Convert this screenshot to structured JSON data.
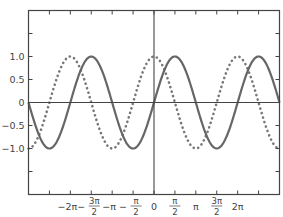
{
  "chart_data": {
    "type": "line",
    "title": "",
    "xlabel": "",
    "ylabel": "",
    "xlim": [
      -9.42478,
      9.42478
    ],
    "ylim": [
      -2.0,
      2.0
    ],
    "grid": false,
    "legend": null,
    "frame": "box with axis lines through origin",
    "series": [
      {
        "name": "sin(x)",
        "style": "solid",
        "color": "#666666",
        "function": "sin"
      },
      {
        "name": "cos(x)",
        "style": "dotted",
        "color": "#777777",
        "function": "cos"
      }
    ],
    "x_ticks": [
      {
        "value": -7.85398,
        "label": ""
      },
      {
        "value": -6.28319,
        "label": "−2π"
      },
      {
        "value": -4.71239,
        "label": "−3π/2",
        "num": "3π",
        "den": "2",
        "neg": true
      },
      {
        "value": -3.14159,
        "label": "−π"
      },
      {
        "value": -1.5708,
        "label": "−π/2",
        "num": "π",
        "den": "2",
        "neg": true
      },
      {
        "value": 0,
        "label": "0"
      },
      {
        "value": 1.5708,
        "label": "π/2",
        "num": "π",
        "den": "2",
        "neg": false
      },
      {
        "value": 3.14159,
        "label": "π"
      },
      {
        "value": 4.71239,
        "label": "3π/2",
        "num": "3π",
        "den": "2",
        "neg": false
      },
      {
        "value": 6.28319,
        "label": "2π"
      },
      {
        "value": 7.85398,
        "label": ""
      }
    ],
    "y_ticks": [
      {
        "value": 1.5,
        "label": ""
      },
      {
        "value": 1.0,
        "label": "1.0"
      },
      {
        "value": 0.5,
        "label": "0.5"
      },
      {
        "value": 0,
        "label": "0"
      },
      {
        "value": -0.5,
        "label": "−0.5"
      },
      {
        "value": -1.0,
        "label": "−1.0"
      },
      {
        "value": -1.5,
        "label": ""
      }
    ],
    "sample_points": {
      "x": [
        -9.42,
        -7.85,
        -6.28,
        -4.71,
        -3.14,
        -1.57,
        0,
        1.57,
        3.14,
        4.71,
        6.28,
        7.85,
        9.42
      ],
      "sin": [
        0,
        -1,
        0,
        1,
        0,
        -1,
        0,
        1,
        0,
        -1,
        0,
        1,
        0
      ],
      "cos": [
        -1,
        0,
        1,
        0,
        -1,
        0,
        1,
        0,
        -1,
        0,
        1,
        0,
        -1
      ]
    }
  },
  "colors": {
    "axis": "#444444",
    "sin_line": "#666666",
    "cos_line": "#777777",
    "background": "#ffffff"
  }
}
